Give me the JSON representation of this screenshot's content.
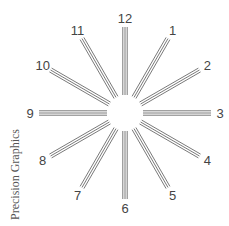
{
  "diagram": {
    "center": [
      125,
      113
    ],
    "inner_radius": 18,
    "outer_radius": 86,
    "label_radius": 95,
    "line_color": "#6a6a6a",
    "line_count_per_spoke": 3,
    "spokes": [
      {
        "label": "12",
        "hour": 12
      },
      {
        "label": "1",
        "hour": 1
      },
      {
        "label": "2",
        "hour": 2
      },
      {
        "label": "3",
        "hour": 3
      },
      {
        "label": "4",
        "hour": 4
      },
      {
        "label": "5",
        "hour": 5
      },
      {
        "label": "6",
        "hour": 6
      },
      {
        "label": "7",
        "hour": 7
      },
      {
        "label": "8",
        "hour": 8
      },
      {
        "label": "9",
        "hour": 9
      },
      {
        "label": "10",
        "hour": 10
      },
      {
        "label": "11",
        "hour": 11
      }
    ]
  },
  "credit": "Precision Graphics"
}
